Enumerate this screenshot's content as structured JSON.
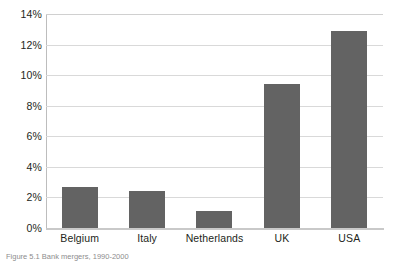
{
  "chart_data": {
    "type": "bar",
    "title": "",
    "xlabel": "",
    "ylabel": "",
    "categories": [
      "Belgium",
      "Italy",
      "Netherlands",
      "UK",
      "USA"
    ],
    "values": [
      2.7,
      2.4,
      1.1,
      9.4,
      12.9
    ],
    "value_unit": "%",
    "ylim": [
      0,
      14
    ],
    "ytick_values": [
      0,
      2,
      4,
      6,
      8,
      10,
      12,
      14
    ],
    "ytick_labels": [
      "0%",
      "2%",
      "4%",
      "6%",
      "8%",
      "10%",
      "12%",
      "14%"
    ],
    "grid": true,
    "legend": false,
    "bar_color": "#636363",
    "gridline_color": "#d9d9d9",
    "axis_color": "#bdbdbd",
    "background": "#ffffff"
  },
  "caption": {
    "text": "Figure 5.1  Bank mergers, 1990-2000"
  }
}
